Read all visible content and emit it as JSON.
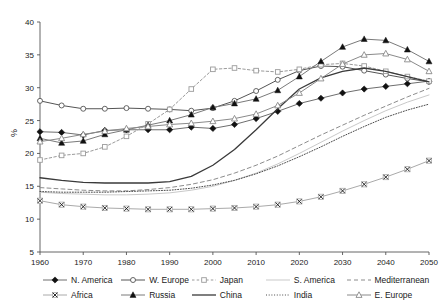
{
  "chart_data": {
    "type": "line",
    "title": "",
    "xlabel": "",
    "ylabel": "%",
    "xlim": [
      1960,
      2050
    ],
    "ylim": [
      5,
      40
    ],
    "xticks": [
      1960,
      1970,
      1980,
      1990,
      2000,
      2010,
      2020,
      2030,
      2040,
      2050
    ],
    "yticks": [
      5,
      10,
      15,
      20,
      25,
      30,
      35,
      40
    ],
    "grid": false,
    "legend_position": "bottom",
    "x": [
      1960,
      1965,
      1970,
      1975,
      1980,
      1985,
      1990,
      1995,
      2000,
      2005,
      2010,
      2015,
      2020,
      2025,
      2030,
      2035,
      2040,
      2045,
      2050
    ],
    "series": [
      {
        "name": "N. America",
        "marker": "filled-diamond",
        "line": "solid",
        "color": "#6e6e6e",
        "values": [
          23.3,
          23.2,
          22.8,
          23.5,
          23.6,
          23.6,
          23.6,
          24.0,
          23.8,
          24.4,
          25.3,
          26.4,
          27.6,
          28.4,
          29.2,
          29.8,
          30.2,
          30.6,
          31.0
        ]
      },
      {
        "name": "W. Europe",
        "marker": "open-circle",
        "line": "solid",
        "color": "#555555",
        "values": [
          28.0,
          27.3,
          26.8,
          26.8,
          26.9,
          26.8,
          26.7,
          26.5,
          26.9,
          28.0,
          29.5,
          31.2,
          32.6,
          33.3,
          33.2,
          32.6,
          32.0,
          31.4,
          30.9
        ]
      },
      {
        "name": "Japan",
        "marker": "open-square",
        "line": "dotted",
        "color": "#9a9a9a",
        "values": [
          19.0,
          19.7,
          20.0,
          21.0,
          22.6,
          24.5,
          26.7,
          29.8,
          32.8,
          33.0,
          32.6,
          32.4,
          32.8,
          33.5,
          33.7,
          33.3,
          32.5,
          31.7,
          31.0
        ]
      },
      {
        "name": "S. America",
        "marker": "none",
        "line": "solid",
        "color": "#c9c9c9",
        "values": [
          14.1,
          13.9,
          13.8,
          13.7,
          13.7,
          13.8,
          14.0,
          14.4,
          15.0,
          15.9,
          17.0,
          18.4,
          20.0,
          21.7,
          23.4,
          25.0,
          26.5,
          27.8,
          28.9
        ]
      },
      {
        "name": "Mediterranean",
        "marker": "none",
        "line": "dashed",
        "color": "#8c8c8c",
        "values": [
          14.8,
          14.6,
          14.4,
          14.3,
          14.3,
          14.5,
          14.8,
          15.3,
          16.0,
          17.0,
          18.2,
          19.6,
          21.2,
          22.8,
          24.3,
          25.8,
          27.2,
          28.6,
          29.9
        ]
      },
      {
        "name": "Africa",
        "marker": "x-square",
        "line": "solid",
        "color": "#aaaaaa",
        "values": [
          12.8,
          12.2,
          11.9,
          11.7,
          11.6,
          11.5,
          11.5,
          11.5,
          11.6,
          11.7,
          11.9,
          12.2,
          12.7,
          13.4,
          14.3,
          15.3,
          16.4,
          17.6,
          18.9
        ]
      },
      {
        "name": "Russia",
        "marker": "filled-triangle",
        "line": "solid",
        "color": "#7a7a7a",
        "values": [
          22.3,
          21.6,
          21.9,
          22.9,
          23.6,
          24.3,
          25.0,
          25.9,
          27.0,
          27.6,
          28.3,
          29.6,
          31.7,
          34.0,
          36.2,
          37.4,
          37.2,
          35.8,
          34.0
        ]
      },
      {
        "name": "China",
        "marker": "none",
        "line": "solid-bold",
        "color": "#3a3a3a",
        "values": [
          16.3,
          15.9,
          15.6,
          15.5,
          15.5,
          15.5,
          15.7,
          16.5,
          18.2,
          20.6,
          23.6,
          26.8,
          29.8,
          31.5,
          32.5,
          33.0,
          32.5,
          31.7,
          30.9
        ]
      },
      {
        "name": "India",
        "marker": "none",
        "line": "fine-dotted",
        "color": "#4a4a4a",
        "values": [
          14.2,
          14.1,
          14.1,
          14.1,
          14.2,
          14.3,
          14.4,
          14.7,
          15.2,
          15.9,
          16.9,
          18.1,
          19.5,
          21.0,
          22.6,
          24.1,
          25.5,
          26.6,
          27.5
        ]
      },
      {
        "name": "E. Europe",
        "marker": "open-triangle",
        "line": "solid",
        "color": "#8a8a8a",
        "values": [
          21.8,
          22.3,
          22.9,
          23.4,
          23.8,
          24.1,
          24.4,
          24.6,
          24.9,
          25.3,
          26.0,
          27.3,
          29.2,
          31.4,
          33.6,
          35.0,
          35.2,
          34.3,
          32.5
        ]
      }
    ]
  },
  "axes": {
    "y_axis_title": "%"
  },
  "legend": {
    "rows": [
      [
        "N. America",
        "W. Europe",
        "Japan",
        "S. America",
        "Mediterranean"
      ],
      [
        "Africa",
        "Russia",
        "China",
        "India",
        "E. Europe"
      ]
    ]
  }
}
